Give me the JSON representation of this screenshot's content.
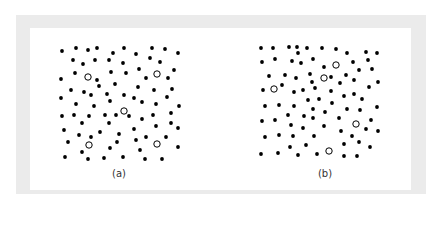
{
  "figure": {
    "panels": [
      {
        "label": "(a)",
        "caption_pos": [
          119,
          174
        ],
        "filled_dots": [
          [
            62,
            51
          ],
          [
            76,
            48
          ],
          [
            88,
            50
          ],
          [
            97,
            48
          ],
          [
            113,
            53
          ],
          [
            124,
            48
          ],
          [
            136,
            54
          ],
          [
            152,
            48
          ],
          [
            165,
            49
          ],
          [
            178,
            53
          ],
          [
            73,
            60
          ],
          [
            83,
            64
          ],
          [
            95,
            60
          ],
          [
            109,
            60
          ],
          [
            123,
            63
          ],
          [
            150,
            58
          ],
          [
            160,
            62
          ],
          [
            75,
            73
          ],
          [
            111,
            72
          ],
          [
            126,
            73
          ],
          [
            139,
            69
          ],
          [
            174,
            70
          ],
          [
            61,
            79
          ],
          [
            97,
            80
          ],
          [
            146,
            78
          ],
          [
            168,
            78
          ],
          [
            99,
            86
          ],
          [
            115,
            84
          ],
          [
            71,
            90
          ],
          [
            84,
            92
          ],
          [
            91,
            95
          ],
          [
            107,
            94
          ],
          [
            138,
            87
          ],
          [
            154,
            90
          ],
          [
            172,
            89
          ],
          [
            61,
            98
          ],
          [
            110,
            101
          ],
          [
            124,
            95
          ],
          [
            134,
            98
          ],
          [
            142,
            102
          ],
          [
            167,
            97
          ],
          [
            76,
            104
          ],
          [
            94,
            106
          ],
          [
            156,
            104
          ],
          [
            179,
            106
          ],
          [
            62,
            116
          ],
          [
            74,
            115
          ],
          [
            89,
            116
          ],
          [
            105,
            115
          ],
          [
            116,
            115
          ],
          [
            129,
            116
          ],
          [
            142,
            119
          ],
          [
            153,
            115
          ],
          [
            171,
            113
          ],
          [
            82,
            123
          ],
          [
            109,
            123
          ],
          [
            156,
            126
          ],
          [
            171,
            123
          ],
          [
            178,
            128
          ],
          [
            64,
            130
          ],
          [
            100,
            132
          ],
          [
            134,
            129
          ],
          [
            79,
            135
          ],
          [
            91,
            137
          ],
          [
            119,
            134
          ],
          [
            146,
            137
          ],
          [
            166,
            137
          ],
          [
            136,
            140
          ],
          [
            68,
            142
          ],
          [
            117,
            142
          ],
          [
            110,
            148
          ],
          [
            140,
            150
          ],
          [
            178,
            147
          ],
          [
            82,
            152
          ],
          [
            65,
            157
          ],
          [
            88,
            159
          ],
          [
            104,
            158
          ],
          [
            123,
            157
          ],
          [
            145,
            159
          ],
          [
            162,
            159
          ]
        ],
        "hollow_dots": [
          [
            88,
            77
          ],
          [
            157,
            74
          ],
          [
            124,
            111
          ],
          [
            89,
            145
          ],
          [
            157,
            144
          ]
        ]
      },
      {
        "label": "(b)",
        "caption_pos": [
          325,
          174
        ],
        "filled_dots": [
          [
            261,
            48
          ],
          [
            273,
            48
          ],
          [
            289,
            47
          ],
          [
            297,
            47
          ],
          [
            307,
            48
          ],
          [
            322,
            48
          ],
          [
            336,
            49
          ],
          [
            347,
            53
          ],
          [
            366,
            52
          ],
          [
            377,
            53
          ],
          [
            298,
            53
          ],
          [
            262,
            62
          ],
          [
            275,
            59
          ],
          [
            292,
            61
          ],
          [
            301,
            63
          ],
          [
            313,
            59
          ],
          [
            324,
            67
          ],
          [
            353,
            62
          ],
          [
            368,
            60
          ],
          [
            359,
            70
          ],
          [
            372,
            69
          ],
          [
            269,
            76
          ],
          [
            285,
            75
          ],
          [
            296,
            78
          ],
          [
            310,
            74
          ],
          [
            312,
            82
          ],
          [
            331,
            77
          ],
          [
            340,
            83
          ],
          [
            346,
            75
          ],
          [
            354,
            80
          ],
          [
            378,
            82
          ],
          [
            369,
            87
          ],
          [
            263,
            90
          ],
          [
            282,
            85
          ],
          [
            294,
            92
          ],
          [
            303,
            90
          ],
          [
            315,
            88
          ],
          [
            331,
            91
          ],
          [
            344,
            96
          ],
          [
            354,
            94
          ],
          [
            362,
            99
          ],
          [
            265,
            106
          ],
          [
            279,
            105
          ],
          [
            294,
            106
          ],
          [
            308,
            100
          ],
          [
            319,
            99
          ],
          [
            332,
            103
          ],
          [
            313,
            109
          ],
          [
            325,
            112
          ],
          [
            347,
            109
          ],
          [
            360,
            110
          ],
          [
            377,
            107
          ],
          [
            288,
            115
          ],
          [
            304,
            116
          ],
          [
            262,
            121
          ],
          [
            275,
            120
          ],
          [
            291,
            125
          ],
          [
            303,
            128
          ],
          [
            313,
            118
          ],
          [
            324,
            126
          ],
          [
            339,
            118
          ],
          [
            371,
            120
          ],
          [
            366,
            129
          ],
          [
            378,
            131
          ],
          [
            341,
            131
          ],
          [
            265,
            137
          ],
          [
            279,
            135
          ],
          [
            293,
            136
          ],
          [
            314,
            136
          ],
          [
            352,
            136
          ],
          [
            344,
            144
          ],
          [
            359,
            142
          ],
          [
            290,
            147
          ],
          [
            306,
            145
          ],
          [
            370,
            147
          ],
          [
            261,
            154
          ],
          [
            278,
            153
          ],
          [
            298,
            155
          ],
          [
            317,
            154
          ],
          [
            344,
            156
          ],
          [
            357,
            156
          ]
        ],
        "hollow_dots": [
          [
            336,
            65
          ],
          [
            324,
            78
          ],
          [
            274,
            89
          ],
          [
            356,
            124
          ],
          [
            329,
            151
          ]
        ]
      }
    ],
    "colors": {
      "frame": "#ebebeb",
      "dot": "#000000",
      "background": "#ffffff"
    }
  }
}
